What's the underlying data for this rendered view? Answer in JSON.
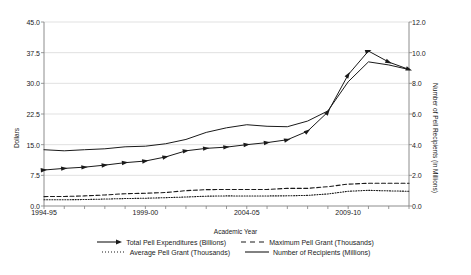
{
  "chart_data": {
    "type": "line",
    "title": "",
    "xlabel": "Academic Year",
    "ylabel": "Dollars",
    "ylabel_right": "Number of Pell Recipients (in Millions)",
    "grid": true,
    "legend_position": "bottom",
    "ylim": [
      0.0,
      45.0
    ],
    "yticks": [
      "0.0",
      "7.5",
      "15.0",
      "22.5",
      "30.0",
      "37.5",
      "45.0"
    ],
    "ylim_right": [
      0.0,
      12.0
    ],
    "yticks_right": [
      "0.0",
      "2.0",
      "4.0",
      "6.0",
      "8.0",
      "10.0",
      "12.0"
    ],
    "x": [
      "1994-95",
      "1995-96",
      "1996-97",
      "1997-98",
      "1998-99",
      "1999-00",
      "2000-01",
      "2001-02",
      "2002-03",
      "2003-04",
      "2004-05",
      "2005-06",
      "2006-07",
      "2007-08",
      "2008-09",
      "2009-10",
      "2010-11",
      "2011-12",
      "2012-13"
    ],
    "xticks_labeled": [
      "1994-95",
      "1999-00",
      "2004-05",
      "2009-10"
    ],
    "series": [
      {
        "name": "Total Pell Expenditures (Billions)",
        "axis": "left",
        "style": "solid-arrow-markers",
        "values": [
          8.8,
          9.2,
          9.5,
          10.0,
          10.6,
          11.0,
          12.0,
          13.5,
          14.1,
          14.4,
          15.0,
          15.5,
          16.2,
          18.3,
          23.0,
          32.1,
          37.9,
          35.2,
          33.4
        ]
      },
      {
        "name": "Maximum Pell Grant (Thousands)",
        "axis": "left",
        "style": "dashed",
        "values": [
          2.3,
          2.34,
          2.47,
          2.7,
          3.0,
          3.12,
          3.3,
          3.75,
          4.0,
          4.05,
          4.05,
          4.05,
          4.31,
          4.31,
          4.73,
          5.35,
          5.55,
          5.55,
          5.55
        ]
      },
      {
        "name": "Average Pell Grant (Thousands)",
        "axis": "left",
        "style": "dotted",
        "values": [
          1.52,
          1.53,
          1.58,
          1.7,
          1.82,
          1.9,
          2.04,
          2.2,
          2.4,
          2.47,
          2.45,
          2.46,
          2.49,
          2.6,
          2.95,
          3.6,
          3.83,
          3.7,
          3.6
        ]
      },
      {
        "name": "Number of Recipients (Millions)",
        "axis": "right",
        "style": "solid",
        "values": [
          3.67,
          3.6,
          3.67,
          3.73,
          3.86,
          3.9,
          4.06,
          4.34,
          4.8,
          5.1,
          5.3,
          5.2,
          5.17,
          5.54,
          6.2,
          8.1,
          9.4,
          9.2,
          8.9
        ]
      }
    ]
  },
  "legend": {
    "items": [
      {
        "label": "Total Pell Expenditures (Billions)",
        "marker": "line-arrow-icon"
      },
      {
        "label": "Maximum Pell Grant (Thousands)",
        "marker": "line-dashed-icon"
      },
      {
        "label": "Average Pell Grant (Thousands)",
        "marker": "line-dotted-icon"
      },
      {
        "label": "Number of Recipients (Millions)",
        "marker": "line-solid-icon"
      }
    ]
  },
  "colors": {
    "line": "#1a1a1a",
    "grid": "#d9d9d9",
    "axis": "#808080",
    "background": "#ffffff"
  }
}
